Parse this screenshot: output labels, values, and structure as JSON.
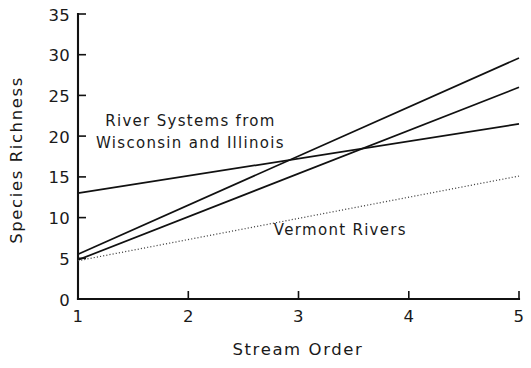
{
  "chart_data": {
    "type": "line",
    "title": "",
    "xlabel": "Stream Order",
    "ylabel": "Species Richness",
    "xlim": [
      1,
      5
    ],
    "ylim": [
      0,
      35
    ],
    "xticks": [
      "1",
      "2",
      "3",
      "4",
      "5"
    ],
    "yticks": [
      "0",
      "5",
      "10",
      "15",
      "20",
      "25",
      "30",
      "35"
    ],
    "grid": false,
    "legend_position": "inline-annotations",
    "x": [
      1,
      5
    ],
    "series": [
      {
        "name": "Regression line 1 (steepest)",
        "style": "solid",
        "color": "#111111",
        "values": [
          5.5,
          29.6
        ]
      },
      {
        "name": "Regression line 2",
        "style": "solid",
        "color": "#111111",
        "values": [
          4.8,
          26.0
        ]
      },
      {
        "name": "Regression line 3 (shallow)",
        "style": "solid",
        "color": "#111111",
        "values": [
          13.0,
          21.5
        ]
      },
      {
        "name": "Vermont Rivers",
        "style": "dotted",
        "color": "#444444",
        "values": [
          4.7,
          15.1
        ]
      }
    ],
    "annotations": [
      {
        "id": "wisconsin-illinois",
        "line1": "River Systems from",
        "line2": "Wisconsin and Illinois",
        "x": 2.02,
        "y": 21.3
      },
      {
        "id": "vermont-rivers",
        "line1": "Vermont Rivers",
        "line2": "",
        "x": 3.38,
        "y": 7.9
      }
    ]
  }
}
